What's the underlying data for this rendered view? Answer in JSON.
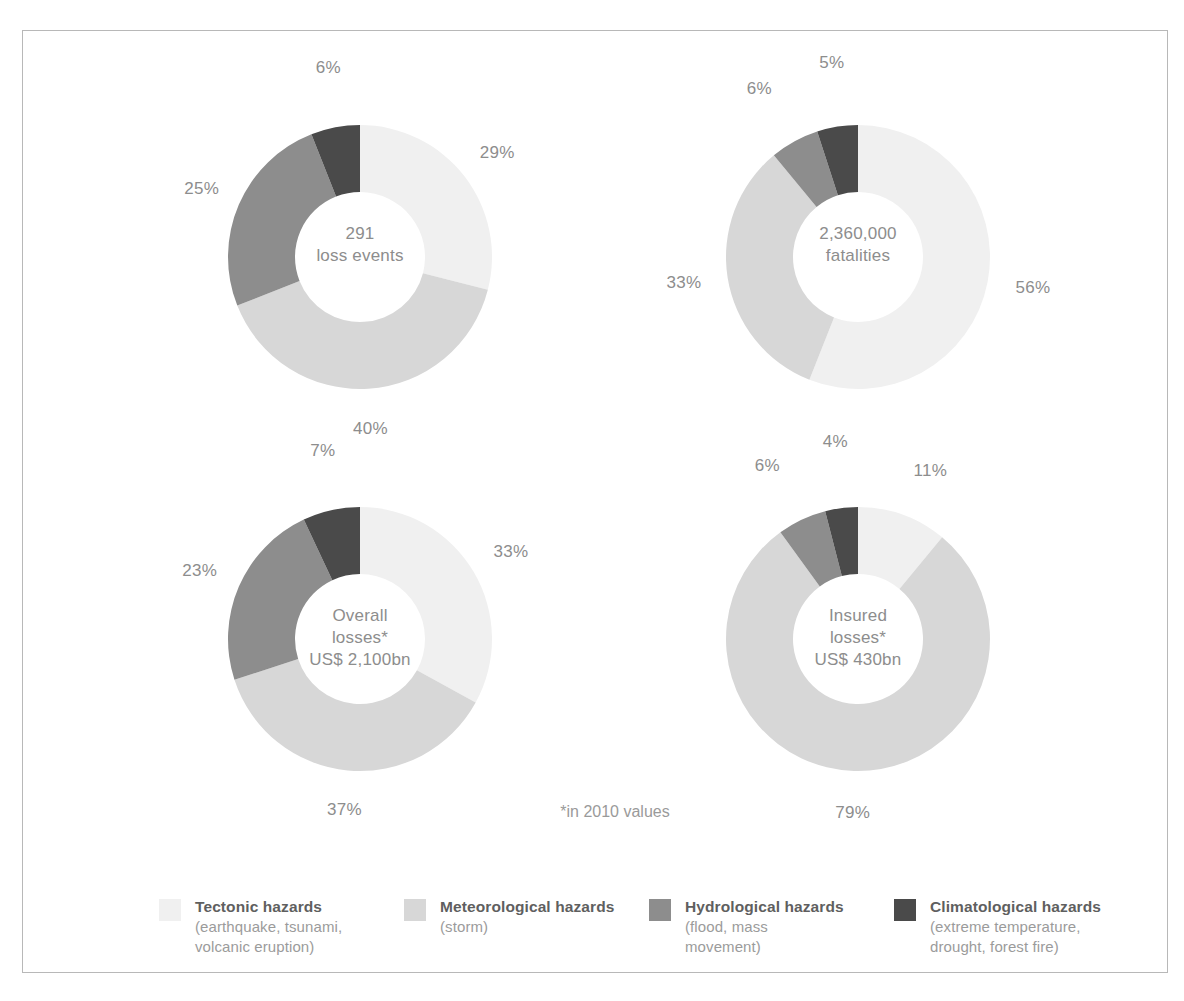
{
  "footnote": "*in 2010 values",
  "colors": {
    "tectonic": "#f0f0f0",
    "meteorological": "#d7d7d7",
    "hydrological": "#8d8d8d",
    "climatological": "#4a4a4a",
    "frame": "#b8b8b8",
    "label_text": "#8d8d8d",
    "legend_title": "#5f5f5f",
    "legend_sub": "#9b9b9b",
    "background": "#ffffff"
  },
  "legend": {
    "items": [
      {
        "name": "tectonic",
        "title": "Tectonic hazards",
        "subtitle": "(earthquake, tsunami,\nvolcanic eruption)",
        "color": "#f0f0f0"
      },
      {
        "name": "meteorological",
        "title": "Meteorological hazards",
        "subtitle": "(storm)",
        "color": "#d7d7d7"
      },
      {
        "name": "hydrological",
        "title": "Hydrological hazards",
        "subtitle": "(flood, mass\nmovement)",
        "color": "#8d8d8d"
      },
      {
        "name": "climatological",
        "title": "Climatological hazards",
        "subtitle": "(extreme temperature,\ndrought, forest fire)",
        "color": "#4a4a4a"
      }
    ]
  },
  "chart_data": [
    {
      "type": "pie",
      "name": "loss-events",
      "title": "291 loss events",
      "center_value": "291",
      "center_unit": "loss events",
      "categories": [
        "Tectonic hazards",
        "Meteorological hazards",
        "Hydrological hazards",
        "Climatological hazards"
      ],
      "values": [
        29,
        40,
        25,
        6
      ],
      "labels": [
        "29%",
        "40%",
        "25%",
        "6%"
      ],
      "colors": [
        "#f0f0f0",
        "#d7d7d7",
        "#8d8d8d",
        "#4a4a4a"
      ]
    },
    {
      "type": "pie",
      "name": "fatalities",
      "title": "2,360,000 fatalities",
      "center_value": "2,360,000",
      "center_unit": "fatalities",
      "categories": [
        "Tectonic hazards",
        "Meteorological hazards",
        "Hydrological hazards",
        "Climatological hazards"
      ],
      "values": [
        56,
        33,
        6,
        5
      ],
      "labels": [
        "56%",
        "33%",
        "6%",
        "5%"
      ],
      "colors": [
        "#f0f0f0",
        "#d7d7d7",
        "#8d8d8d",
        "#4a4a4a"
      ]
    },
    {
      "type": "pie",
      "name": "overall-losses",
      "title": "Overall losses* US$ 2,100bn",
      "center_value": "Overall\nlosses*",
      "center_unit": "US$ 2,100bn",
      "categories": [
        "Tectonic hazards",
        "Meteorological hazards",
        "Hydrological hazards",
        "Climatological hazards"
      ],
      "values": [
        33,
        37,
        23,
        7
      ],
      "labels": [
        "33%",
        "37%",
        "23%",
        "7%"
      ],
      "colors": [
        "#f0f0f0",
        "#d7d7d7",
        "#8d8d8d",
        "#4a4a4a"
      ]
    },
    {
      "type": "pie",
      "name": "insured-losses",
      "title": "Insured losses* US$ 430bn",
      "center_value": "Insured\nlosses*",
      "center_unit": "US$ 430bn",
      "categories": [
        "Tectonic hazards",
        "Meteorological hazards",
        "Hydrological hazards",
        "Climatological hazards"
      ],
      "values": [
        11,
        79,
        6,
        4
      ],
      "labels": [
        "11%",
        "79%",
        "6%",
        "4%"
      ],
      "colors": [
        "#f0f0f0",
        "#d7d7d7",
        "#8d8d8d",
        "#4a4a4a"
      ]
    }
  ]
}
